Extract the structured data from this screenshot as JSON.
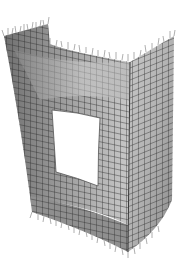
{
  "figure": {
    "kind": "finite-element-mesh",
    "view": "3d-isometric",
    "colors": {
      "background": "#ffffff",
      "surface_light": "#d8d8d8",
      "surface_mid": "#a8a8a8",
      "surface_dark": "#6e6e6e",
      "mesh_line": "#2e2e2e",
      "support_marker": "#9a9a9a",
      "opening": "#ffffff"
    },
    "elements": {
      "top_edge_markers": "load-arrows",
      "bottom_edge_markers": "support-arrows",
      "opening": "rectangular-window"
    }
  }
}
